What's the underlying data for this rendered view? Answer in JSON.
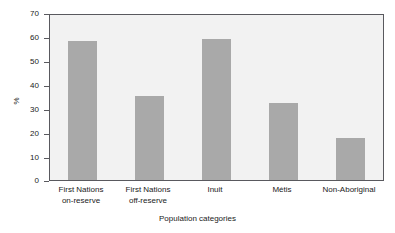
{
  "chart_data": {
    "type": "bar",
    "title": "",
    "xlabel": "Population categories",
    "ylabel": "%",
    "categories": [
      "First Nations on-reserve",
      "First Nations off-reserve",
      "Inuit",
      "Métis",
      "Non-Aboriginal"
    ],
    "category_lines": [
      [
        "First Nations",
        "on-reserve"
      ],
      [
        "First Nations",
        "off-reserve"
      ],
      [
        "Inuit",
        ""
      ],
      [
        "Métis",
        ""
      ],
      [
        "Non-Aboriginal",
        ""
      ]
    ],
    "values": [
      59,
      35.5,
      60,
      32.5,
      18
    ],
    "ylim": [
      0,
      70
    ],
    "yticks": [
      0,
      10,
      20,
      30,
      40,
      50,
      60,
      70
    ],
    "ytick_labels": [
      "0",
      "10",
      "20",
      "30",
      "40",
      "50",
      "60",
      "70"
    ],
    "grid": false,
    "legend": "none",
    "bar_color": "#a9a9a9",
    "plot_background": "#f2f2f2",
    "axis_color": "#59595e",
    "figure_background": "#ffffff"
  }
}
